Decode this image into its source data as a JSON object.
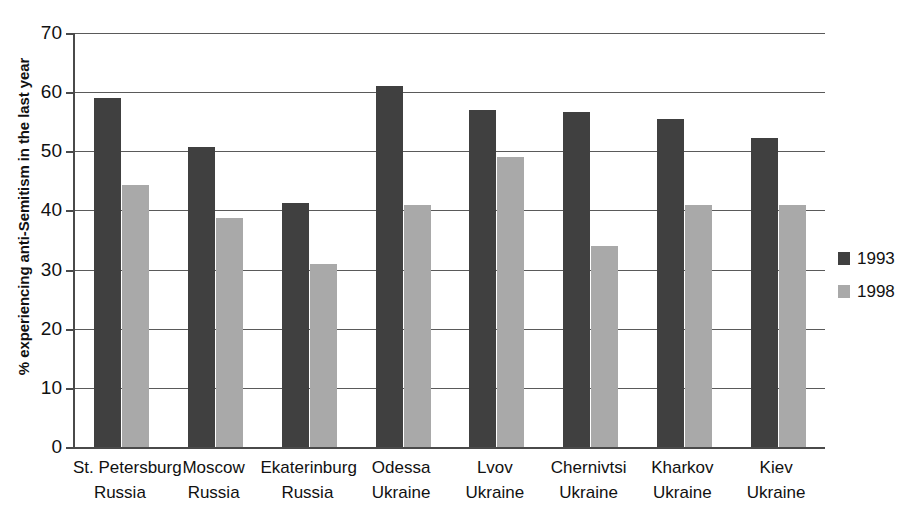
{
  "chart_data": {
    "type": "bar",
    "title": "",
    "xlabel": "",
    "ylabel": "% experiencing anti-Semitism in the last year",
    "ylim": [
      0,
      70
    ],
    "yticks": [
      0,
      10,
      20,
      30,
      40,
      50,
      60,
      70
    ],
    "grid": true,
    "legend_position": "right",
    "categories": [
      "St. Petersburg Russia",
      "Moscow Russia",
      "Ekaterinburg Russia",
      "Odessa Ukraine",
      "Lvov Ukraine",
      "Chernivtsi Ukraine",
      "Kharkov Ukraine",
      "Kiev Ukraine"
    ],
    "category_lines": [
      [
        "St. Petersburg",
        "Russia"
      ],
      [
        "Moscow",
        "Russia"
      ],
      [
        "Ekaterinburg",
        "Russia"
      ],
      [
        "Odessa",
        "Ukraine"
      ],
      [
        "Lvov",
        "Ukraine"
      ],
      [
        "Chernivtsi",
        "Ukraine"
      ],
      [
        "Kharkov",
        "Ukraine"
      ],
      [
        "Kiev",
        "Ukraine"
      ]
    ],
    "series": [
      {
        "name": "1993",
        "color": "#404040",
        "values": [
          59.0,
          50.7,
          41.3,
          61.0,
          57.0,
          56.7,
          55.5,
          52.3
        ]
      },
      {
        "name": "1998",
        "color": "#a9a9a9",
        "values": [
          44.3,
          38.7,
          31.0,
          41.0,
          49.0,
          34.0,
          41.0,
          41.0
        ]
      }
    ]
  },
  "legend": {
    "items": [
      {
        "label": "1993",
        "color": "#404040"
      },
      {
        "label": "1998",
        "color": "#a9a9a9"
      }
    ]
  },
  "axes": {
    "y_title": "% experiencing anti-Semitism in the last year",
    "y_tick_labels": [
      "0",
      "10",
      "20",
      "30",
      "40",
      "50",
      "60",
      "70"
    ]
  }
}
